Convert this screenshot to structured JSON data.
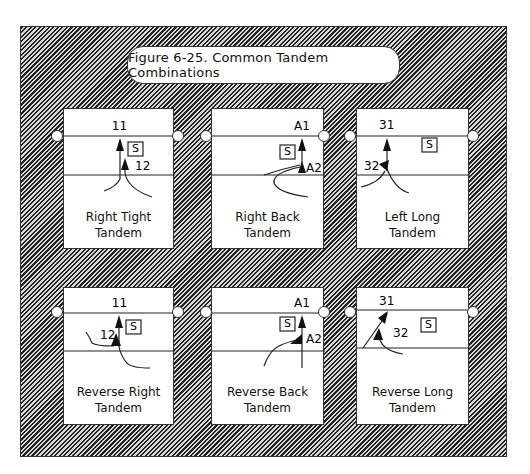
{
  "figure": {
    "title": "Figure 6-25. Common Tandem Combinations"
  },
  "panels": [
    {
      "id": "right-tight",
      "caption_line1": "Right Tight",
      "caption_line2": "Tandem",
      "player_top": "11",
      "player_bottom": "12",
      "box_label": "S"
    },
    {
      "id": "right-back",
      "caption_line1": "Right Back",
      "caption_line2": "Tandem",
      "player_top": "A1",
      "player_bottom": "A2",
      "box_label": "S"
    },
    {
      "id": "left-long",
      "caption_line1": "Left Long",
      "caption_line2": "Tandem",
      "player_top": "31",
      "player_bottom": "32",
      "box_label": "S"
    },
    {
      "id": "reverse-right",
      "caption_line1": "Reverse Right",
      "caption_line2": "Tandem",
      "player_top": "11",
      "player_bottom": "12",
      "box_label": "S"
    },
    {
      "id": "reverse-back",
      "caption_line1": "Reverse Back",
      "caption_line2": "Tandem",
      "player_top": "A1",
      "player_bottom": "A2",
      "box_label": "S"
    },
    {
      "id": "reverse-long",
      "caption_line1": "Reverse Long",
      "caption_line2": "Tandem",
      "player_top": "31",
      "player_bottom": "32",
      "box_label": "S"
    }
  ],
  "colors": {
    "line": "#222222",
    "hatch_dark": "#222222",
    "hatch_light": "#d8d8d8",
    "panel": "#ffffff"
  }
}
